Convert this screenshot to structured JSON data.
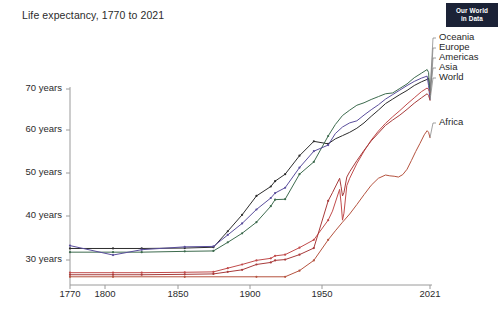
{
  "header": {
    "title": "Life expectancy, 1770 to 2021",
    "logo": {
      "line1": "Our World",
      "line2": "in Data"
    }
  },
  "chart_data": {
    "type": "line",
    "title": "Life expectancy, 1770 to 2021",
    "xlabel": "",
    "ylabel": "",
    "xlim": [
      1770,
      2021
    ],
    "ylim": [
      26,
      74
    ],
    "grid": false,
    "legend_position": "right-inline",
    "xticks": [
      1770,
      1800,
      1850,
      1900,
      1950,
      2021
    ],
    "xtick_labels": [
      "1770",
      "1800",
      "1850",
      "1900",
      "1950",
      "2021"
    ],
    "yticks": [
      30,
      40,
      50,
      60,
      70
    ],
    "ytick_labels": [
      "30 years",
      "40 years",
      "50 years",
      "60 years",
      "70 years"
    ],
    "series": [
      {
        "name": "Oceania",
        "color": "#2d2d2d",
        "label_color": "#1f1f1f",
        "label_y": 38,
        "x": [
          1770,
          1800,
          1820,
          1850,
          1870,
          1880,
          1890,
          1900,
          1910,
          1913,
          1920,
          1930,
          1940,
          1950,
          1955,
          1960,
          1965,
          1970,
          1975,
          1980,
          1985,
          1990,
          1995,
          2000,
          2005,
          2010,
          2015,
          2019,
          2020,
          2021
        ],
        "y": [
          34.9,
          34.9,
          34.9,
          35.0,
          35.2,
          39.1,
          43.1,
          47.7,
          50.0,
          51.3,
          53.0,
          57.5,
          61.0,
          60.4,
          61.6,
          62.4,
          63.2,
          64.2,
          65.5,
          67.1,
          68.6,
          70.2,
          71.3,
          72.4,
          73.4,
          74.6,
          75.5,
          76.1,
          76.4,
          73.1
        ]
      },
      {
        "name": "Europe",
        "color": "#3d6b4e",
        "label_color": "#1f1f1f",
        "label_y": 48,
        "x": [
          1770,
          1800,
          1820,
          1850,
          1870,
          1880,
          1890,
          1900,
          1910,
          1913,
          1920,
          1930,
          1940,
          1950,
          1955,
          1960,
          1965,
          1970,
          1975,
          1980,
          1985,
          1990,
          1995,
          2000,
          2005,
          2010,
          2015,
          2019,
          2020,
          2021
        ],
        "y": [
          34.0,
          34.0,
          34.0,
          34.2,
          34.3,
          36.4,
          38.6,
          41.3,
          45.2,
          46.8,
          46.9,
          53.0,
          56.0,
          62.3,
          65.1,
          67.3,
          68.6,
          69.8,
          70.4,
          71.2,
          71.9,
          72.6,
          72.8,
          73.9,
          75.0,
          76.5,
          77.6,
          78.5,
          77.8,
          72.4
        ]
      },
      {
        "name": "Americas",
        "color": "#5a4e9c",
        "label_color": "#1f1f1f",
        "label_y": 58,
        "x": [
          1770,
          1800,
          1820,
          1850,
          1870,
          1880,
          1890,
          1900,
          1910,
          1913,
          1920,
          1930,
          1940,
          1950,
          1955,
          1960,
          1965,
          1970,
          1975,
          1980,
          1985,
          1990,
          1995,
          2000,
          2005,
          2010,
          2015,
          2019,
          2020,
          2021
        ],
        "y": [
          35.6,
          33.3,
          34.6,
          35.3,
          35.4,
          38.2,
          41.0,
          44.4,
          47.2,
          48.4,
          49.7,
          54.6,
          58.6,
          60.1,
          62.9,
          64.5,
          65.5,
          66.0,
          67.4,
          68.7,
          69.9,
          71.3,
          72.4,
          73.5,
          74.6,
          75.6,
          76.4,
          76.9,
          74.6,
          71.2
        ]
      },
      {
        "name": "Asia",
        "color": "#c14b4b",
        "label_color": "#1f1f1f",
        "label_y": 68,
        "x": [
          1770,
          1800,
          1820,
          1850,
          1870,
          1880,
          1890,
          1900,
          1910,
          1913,
          1920,
          1930,
          1940,
          1950,
          1953,
          1956,
          1958,
          1959,
          1960,
          1961,
          1963,
          1965,
          1970,
          1975,
          1980,
          1985,
          1990,
          1995,
          2000,
          2005,
          2010,
          2015,
          2019,
          2020,
          2021
        ],
        "y": [
          29.0,
          29.0,
          29.0,
          29.1,
          29.2,
          30.1,
          31.0,
          32.0,
          32.5,
          33.1,
          33.4,
          35.1,
          37.0,
          41.8,
          44.0,
          47.2,
          49.3,
          46.0,
          41.8,
          43.5,
          50.2,
          52.0,
          55.6,
          58.6,
          61.3,
          63.5,
          65.4,
          67.0,
          68.5,
          70.1,
          71.6,
          73.1,
          74.0,
          73.6,
          72.9
        ]
      },
      {
        "name": "World",
        "color": "#a83b3b",
        "label_color": "#1f1f1f",
        "label_y": 78,
        "x": [
          1770,
          1800,
          1820,
          1850,
          1870,
          1880,
          1890,
          1900,
          1910,
          1913,
          1920,
          1930,
          1940,
          1950,
          1953,
          1956,
          1958,
          1959,
          1960,
          1961,
          1963,
          1965,
          1970,
          1975,
          1980,
          1985,
          1990,
          1995,
          2000,
          2005,
          2010,
          2015,
          2019,
          2020,
          2021
        ],
        "y": [
          28.5,
          28.5,
          28.5,
          28.6,
          28.7,
          29.2,
          29.7,
          31.0,
          31.5,
          32.0,
          32.2,
          33.4,
          35.0,
          46.5,
          48.5,
          50.6,
          52.0,
          50.0,
          47.7,
          48.5,
          52.3,
          53.6,
          56.3,
          58.8,
          61.1,
          63.0,
          64.9,
          66.2,
          67.4,
          68.8,
          70.3,
          71.6,
          72.6,
          72.2,
          71.0
        ]
      },
      {
        "name": "Africa",
        "color": "#b5533f",
        "label_color": "#1f1f1f",
        "label_y": 123,
        "x": [
          1770,
          1800,
          1850,
          1900,
          1920,
          1930,
          1940,
          1950,
          1955,
          1960,
          1965,
          1970,
          1975,
          1980,
          1985,
          1990,
          1993,
          1996,
          1999,
          2002,
          2005,
          2008,
          2011,
          2014,
          2017,
          2019,
          2020,
          2021
        ],
        "y": [
          28.0,
          28.0,
          28.0,
          28.0,
          28.0,
          29.5,
          32.0,
          37.0,
          39.2,
          41.3,
          43.3,
          45.6,
          48.0,
          50.3,
          52.0,
          52.8,
          52.6,
          52.5,
          52.3,
          52.9,
          54.2,
          56.3,
          58.5,
          60.5,
          62.6,
          63.6,
          63.2,
          61.9
        ]
      }
    ]
  },
  "plot_geometry": {
    "x_left_px": 70,
    "x_right_px": 430,
    "y_top_px": 88,
    "y_bottom_px": 285,
    "x_min_year": 1770,
    "x_max_year": 2021,
    "y_min_val": 26,
    "y_max_val": 74
  },
  "axis": {
    "y_tick_pixels": [
      {
        "label": "70 years",
        "y": 89
      },
      {
        "label": "60 years",
        "y": 130
      },
      {
        "label": "50 years",
        "y": 173
      },
      {
        "label": "40 years",
        "y": 216
      },
      {
        "label": "30 years",
        "y": 260
      }
    ],
    "x_tick_pixels": [
      {
        "label": "1770",
        "x": 70
      },
      {
        "label": "1800",
        "x": 105
      },
      {
        "label": "1850",
        "x": 178
      },
      {
        "label": "1900",
        "x": 250
      },
      {
        "label": "1950",
        "x": 322
      },
      {
        "label": "2021",
        "x": 430
      }
    ]
  }
}
